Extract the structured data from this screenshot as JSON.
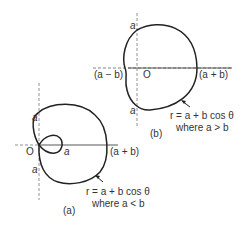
{
  "figure_b": {
    "caption": "(b)",
    "origin_label": "O",
    "top_intercept": "a",
    "bottom_intercept": "a",
    "left_intercept": "(a − b)",
    "right_intercept": "(a + b)",
    "equation": "r = a + b cos θ",
    "condition": "where a > b"
  },
  "figure_a": {
    "caption": "(a)",
    "origin_label": "O",
    "top_intercept": "a",
    "bottom_intercept": "a",
    "inner_loop_label": "a",
    "right_intercept": "(a + b)",
    "equation": "r = a + b cos θ",
    "condition": "where a < b"
  }
}
